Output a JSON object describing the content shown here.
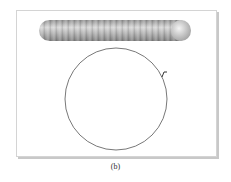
{
  "figure": {
    "caption": "(b)",
    "rod": {
      "segments": 22,
      "color": "#a8a8a8"
    },
    "circle": {
      "cx": 116,
      "cy": 99,
      "r": 51,
      "stroke": "#555555"
    },
    "marker": {
      "x": 163,
      "y": 75
    },
    "frame_border": "#d4d4d4"
  }
}
